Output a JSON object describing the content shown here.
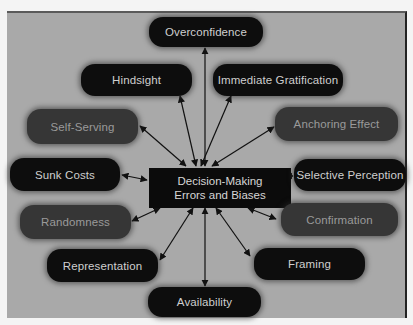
{
  "diagram": {
    "center": {
      "line1": "Decision-Making",
      "line2": "Errors and Biases"
    },
    "nodes": [
      {
        "id": "overconfidence",
        "label": "Overconfidence",
        "shade": "dark"
      },
      {
        "id": "hindsight",
        "label": "Hindsight",
        "shade": "dark"
      },
      {
        "id": "immediate-gratification",
        "label": "Immediate Gratification",
        "shade": "dark"
      },
      {
        "id": "self-serving",
        "label": "Self-Serving",
        "shade": "mid"
      },
      {
        "id": "anchoring-effect",
        "label": "Anchoring Effect",
        "shade": "mid"
      },
      {
        "id": "sunk-costs",
        "label": "Sunk Costs",
        "shade": "dark"
      },
      {
        "id": "selective-perception",
        "label": "Selective Perception",
        "shade": "dark"
      },
      {
        "id": "randomness",
        "label": "Randomness",
        "shade": "mid"
      },
      {
        "id": "confirmation",
        "label": "Confirmation",
        "shade": "mid"
      },
      {
        "id": "representation",
        "label": "Representation",
        "shade": "dark"
      },
      {
        "id": "framing",
        "label": "Framing",
        "shade": "dark"
      },
      {
        "id": "availability",
        "label": "Availability",
        "shade": "dark"
      }
    ],
    "colors": {
      "background": "#a9a9a9",
      "dark_node": "#0d0d0d",
      "mid_node": "#363636",
      "arrow": "#111111"
    }
  }
}
